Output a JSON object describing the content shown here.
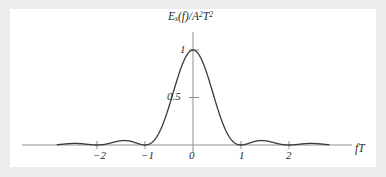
{
  "figure": {
    "background_color": "#ececed",
    "plot_background_color": "#ffffff",
    "curve_color": "#3a3a3a",
    "axis_color": "#8c8c8c"
  },
  "axis_titles": {
    "y_prefix": "E",
    "y_subscript": "s",
    "y_mid": "(f)/A",
    "y_sup1": "2",
    "y_tail": "T",
    "y_sup2": "2",
    "y_full": "E_s(f)/A^2T^2",
    "x": "fT"
  },
  "y_ticks": [
    {
      "value": 1,
      "label": "1"
    },
    {
      "value": 0.5,
      "label": "0.5"
    }
  ],
  "x_ticks": [
    {
      "value": -2,
      "label": "−2"
    },
    {
      "value": -1,
      "label": "−1"
    },
    {
      "value": 0,
      "label": "0"
    },
    {
      "value": 1,
      "label": "1"
    },
    {
      "value": 2,
      "label": "2"
    }
  ],
  "chart_data": {
    "type": "line",
    "title": "",
    "subtitle": "",
    "xlabel": "fT",
    "ylabel": "E_s(f)/A^2T^2",
    "function": "sinc^2(fT) = (sin(pi*fT)/(pi*fT))^2",
    "xlim": [
      -2.83,
      2.83
    ],
    "ylim": [
      0,
      1.08
    ],
    "grid": false,
    "legend": null,
    "x_tick_values": [
      -2,
      -1,
      0,
      1,
      2
    ],
    "x_tick_labels": [
      "−2",
      "−1",
      "0",
      "1",
      "2"
    ],
    "y_tick_values": [
      0.5,
      1
    ],
    "y_tick_labels": [
      "0.5",
      "1"
    ],
    "series": [
      {
        "name": "sinc squared",
        "color": "#3a3a3a",
        "x": [
          -2.83,
          -2.75,
          -2.6,
          -2.5,
          -2.4,
          -2.25,
          -2.1,
          -2.0,
          -1.9,
          -1.75,
          -1.6,
          -1.5,
          -1.4,
          -1.25,
          -1.1,
          -1.0,
          -0.9,
          -0.8,
          -0.7,
          -0.6,
          -0.5,
          -0.4,
          -0.3,
          -0.2,
          -0.1,
          0.0,
          0.1,
          0.2,
          0.3,
          0.4,
          0.5,
          0.6,
          0.7,
          0.8,
          0.9,
          1.0,
          1.1,
          1.25,
          1.4,
          1.5,
          1.6,
          1.75,
          1.9,
          2.0,
          2.1,
          2.25,
          2.4,
          2.5,
          2.6,
          2.75,
          2.83
        ],
        "y": [
          0.0127,
          0.0134,
          0.0132,
          0.0162,
          0.0177,
          0.0162,
          0.0094,
          0.0,
          0.0108,
          0.0327,
          0.0434,
          0.045,
          0.0406,
          0.0242,
          0.0083,
          0.0,
          0.0109,
          0.0547,
          0.1261,
          0.2172,
          0.4053,
          0.5725,
          0.7368,
          0.8751,
          0.9675,
          1.0,
          0.9675,
          0.8751,
          0.7368,
          0.5725,
          0.4053,
          0.2172,
          0.1261,
          0.0547,
          0.0109,
          0.0,
          0.0083,
          0.0242,
          0.0406,
          0.045,
          0.0434,
          0.0327,
          0.0108,
          0.0,
          0.0094,
          0.0162,
          0.0177,
          0.0162,
          0.0132,
          0.0134,
          0.0127
        ]
      }
    ],
    "annotations": [
      {
        "text": "1",
        "x": 0,
        "y": 1
      },
      {
        "text": "0.5",
        "x": 0,
        "y": 0.5
      }
    ]
  }
}
